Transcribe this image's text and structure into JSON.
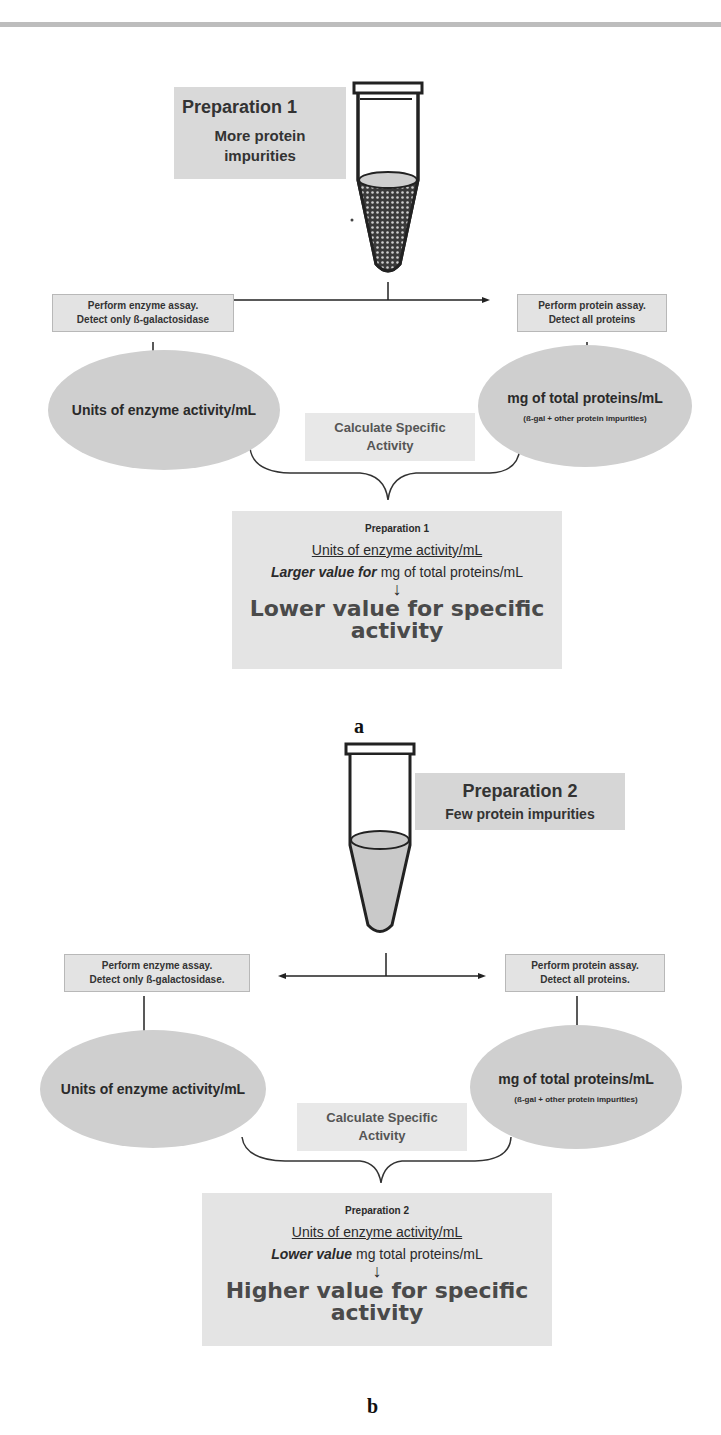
{
  "figure": {
    "panels": [
      {
        "id": "a",
        "panel_label": "a",
        "preparation_label": {
          "title": "Preparation 1",
          "subtitle": "More protein impurities"
        },
        "tube": {
          "contents": "dotted-pattern",
          "liquid_color": "#555555"
        },
        "enzyme_assay_box": {
          "line1": "Perform enzyme assay.",
          "line2": "Detect only ß-galactosidase"
        },
        "protein_assay_box": {
          "line1": "Perform protein assay.",
          "line2": "Detect all proteins"
        },
        "enzyme_ellipse": {
          "text": "Units of enzyme activity/mL"
        },
        "protein_ellipse": {
          "text": "mg of total proteins/mL",
          "subtext": "(ß-gal + other protein impurities)"
        },
        "calculate_box": {
          "line1": "Calculate Specific",
          "line2": "Activity"
        },
        "result_box": {
          "title": "Preparation 1",
          "units": "Units of enzyme activity/mL",
          "denominator_italic": "Larger value for",
          "denominator_rest": " mg of total proteins/mL",
          "arrow": "↓",
          "conclusion_line1": "Lower value for specific",
          "conclusion_line2": "activity"
        }
      },
      {
        "id": "b",
        "panel_label": "b",
        "preparation_label": {
          "title": "Preparation 2",
          "subtitle": "Few protein impurities"
        },
        "tube": {
          "contents": "light-fill",
          "liquid_color": "#c8c8c8"
        },
        "enzyme_assay_box": {
          "line1": "Perform enzyme assay.",
          "line2": "Detect only ß-galactosidase."
        },
        "protein_assay_box": {
          "line1": "Perform protein assay.",
          "line2": "Detect all proteins."
        },
        "enzyme_ellipse": {
          "text": "Units of enzyme activity/mL"
        },
        "protein_ellipse": {
          "text": "mg of total proteins/mL",
          "subtext": "(ß-gal + other protein impurities)"
        },
        "calculate_box": {
          "line1": "Calculate Specific",
          "line2": "Activity"
        },
        "result_box": {
          "title": "Preparation 2",
          "units": "Units of enzyme activity/mL",
          "denominator_italic": "Lower value",
          "denominator_rest": " mg total proteins/mL",
          "arrow": "↓",
          "conclusion_line1": "Higher value for specific",
          "conclusion_line2": "activity"
        }
      }
    ]
  }
}
